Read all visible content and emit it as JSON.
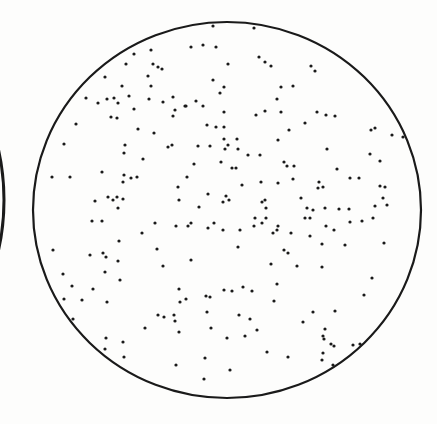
{
  "figure": {
    "background_color": "#fdfdfc",
    "ink_color": "#1a1a1a",
    "plate": {
      "cx": 227,
      "cy": 210,
      "rx": 194,
      "ry": 188,
      "stroke_width": 2.2
    },
    "neighbor_arc": {
      "cx": -150,
      "cy": 200,
      "rx": 154,
      "ry": 190,
      "stroke_width": 3
    },
    "dot_radius": 1.6,
    "dots": [
      [
        213,
        26
      ],
      [
        191,
        47
      ],
      [
        203,
        45
      ],
      [
        216,
        47
      ],
      [
        151,
        50
      ],
      [
        134,
        54
      ],
      [
        126,
        64
      ],
      [
        153,
        64
      ],
      [
        158,
        67
      ],
      [
        162,
        69
      ],
      [
        105,
        77
      ],
      [
        148,
        76
      ],
      [
        213,
        80
      ],
      [
        122,
        86
      ],
      [
        151,
        86
      ],
      [
        86,
        98
      ],
      [
        98,
        103
      ],
      [
        107,
        99
      ],
      [
        114,
        98
      ],
      [
        118,
        103
      ],
      [
        129,
        96
      ],
      [
        149,
        99
      ],
      [
        163,
        102
      ],
      [
        173,
        97
      ],
      [
        196,
        101
      ],
      [
        186,
        106
      ],
      [
        203,
        106
      ],
      [
        134,
        109
      ],
      [
        175,
        110
      ],
      [
        185,
        106
      ],
      [
        111,
        117
      ],
      [
        117,
        118
      ],
      [
        173,
        116
      ],
      [
        207,
        125
      ],
      [
        216,
        127
      ],
      [
        138,
        129
      ],
      [
        154,
        133
      ],
      [
        76,
        124
      ],
      [
        64,
        144
      ],
      [
        125,
        145
      ],
      [
        124,
        153
      ],
      [
        168,
        147
      ],
      [
        198,
        146
      ],
      [
        210,
        146
      ],
      [
        172,
        145
      ],
      [
        143,
        159
      ],
      [
        194,
        164
      ],
      [
        52,
        177
      ],
      [
        70,
        177
      ],
      [
        102,
        172
      ],
      [
        124,
        175
      ],
      [
        123,
        182
      ],
      [
        131,
        178
      ],
      [
        137,
        177
      ],
      [
        178,
        187
      ],
      [
        187,
        177
      ],
      [
        208,
        194
      ],
      [
        179,
        200
      ],
      [
        95,
        201
      ],
      [
        108,
        197
      ],
      [
        113,
        200
      ],
      [
        117,
        197
      ],
      [
        123,
        199
      ],
      [
        118,
        208
      ],
      [
        199,
        207
      ],
      [
        254,
        28
      ],
      [
        228,
        64
      ],
      [
        259,
        57
      ],
      [
        265,
        62
      ],
      [
        271,
        66
      ],
      [
        311,
        66
      ],
      [
        315,
        71
      ],
      [
        224,
        87
      ],
      [
        281,
        87
      ],
      [
        293,
        86
      ],
      [
        220,
        93
      ],
      [
        277,
        99
      ],
      [
        224,
        112
      ],
      [
        256,
        115
      ],
      [
        265,
        111
      ],
      [
        281,
        112
      ],
      [
        317,
        112
      ],
      [
        326,
        115
      ],
      [
        335,
        116
      ],
      [
        305,
        123
      ],
      [
        224,
        127
      ],
      [
        224,
        139
      ],
      [
        228,
        145
      ],
      [
        237,
        139
      ],
      [
        278,
        140
      ],
      [
        289,
        130
      ],
      [
        225,
        149
      ],
      [
        238,
        149
      ],
      [
        248,
        155
      ],
      [
        260,
        155
      ],
      [
        327,
        149
      ],
      [
        371,
        130
      ],
      [
        375,
        128
      ],
      [
        392,
        135
      ],
      [
        403,
        137
      ],
      [
        370,
        154
      ],
      [
        380,
        161
      ],
      [
        221,
        162
      ],
      [
        232,
        168
      ],
      [
        236,
        168
      ],
      [
        284,
        162
      ],
      [
        287,
        166
      ],
      [
        294,
        166
      ],
      [
        337,
        169
      ],
      [
        359,
        178
      ],
      [
        350,
        178
      ],
      [
        380,
        186
      ],
      [
        385,
        187
      ],
      [
        242,
        185
      ],
      [
        261,
        182
      ],
      [
        278,
        183
      ],
      [
        293,
        179
      ],
      [
        319,
        182
      ],
      [
        323,
        187
      ],
      [
        318,
        188
      ],
      [
        387,
        205
      ],
      [
        383,
        198
      ],
      [
        226,
        196
      ],
      [
        223,
        202
      ],
      [
        229,
        200
      ],
      [
        262,
        202
      ],
      [
        265,
        200
      ],
      [
        266,
        208
      ],
      [
        301,
        198
      ],
      [
        307,
        208
      ],
      [
        313,
        210
      ],
      [
        325,
        208
      ],
      [
        339,
        209
      ],
      [
        349,
        209
      ],
      [
        375,
        206
      ],
      [
        92,
        221
      ],
      [
        102,
        221
      ],
      [
        155,
        223
      ],
      [
        176,
        226
      ],
      [
        142,
        233
      ],
      [
        188,
        226
      ],
      [
        191,
        223
      ],
      [
        208,
        228
      ],
      [
        214,
        223
      ],
      [
        119,
        241
      ],
      [
        53,
        250
      ],
      [
        90,
        255
      ],
      [
        103,
        253
      ],
      [
        106,
        257
      ],
      [
        118,
        261
      ],
      [
        157,
        249
      ],
      [
        163,
        266
      ],
      [
        191,
        260
      ],
      [
        105,
        272
      ],
      [
        63,
        274
      ],
      [
        72,
        286
      ],
      [
        93,
        289
      ],
      [
        82,
        300
      ],
      [
        64,
        299
      ],
      [
        107,
        302
      ],
      [
        120,
        280
      ],
      [
        179,
        289
      ],
      [
        186,
        299
      ],
      [
        180,
        302
      ],
      [
        206,
        296
      ],
      [
        207,
        312
      ],
      [
        211,
        328
      ],
      [
        158,
        315
      ],
      [
        164,
        317
      ],
      [
        174,
        315
      ],
      [
        175,
        321
      ],
      [
        179,
        332
      ],
      [
        145,
        328
      ],
      [
        210,
        297
      ],
      [
        73,
        319
      ],
      [
        106,
        338
      ],
      [
        123,
        342
      ],
      [
        105,
        349
      ],
      [
        124,
        357
      ],
      [
        176,
        365
      ],
      [
        205,
        358
      ],
      [
        204,
        379
      ],
      [
        223,
        230
      ],
      [
        240,
        230
      ],
      [
        255,
        218
      ],
      [
        254,
        226
      ],
      [
        262,
        223
      ],
      [
        266,
        218
      ],
      [
        278,
        226
      ],
      [
        277,
        230
      ],
      [
        273,
        233
      ],
      [
        305,
        218
      ],
      [
        291,
        233
      ],
      [
        310,
        218
      ],
      [
        334,
        230
      ],
      [
        326,
        226
      ],
      [
        350,
        222
      ],
      [
        362,
        221
      ],
      [
        373,
        218
      ],
      [
        384,
        243
      ],
      [
        238,
        247
      ],
      [
        284,
        250
      ],
      [
        288,
        253
      ],
      [
        310,
        236
      ],
      [
        322,
        244
      ],
      [
        345,
        245
      ],
      [
        322,
        267
      ],
      [
        271,
        264
      ],
      [
        277,
        284
      ],
      [
        297,
        266
      ],
      [
        224,
        290
      ],
      [
        232,
        291
      ],
      [
        243,
        287
      ],
      [
        252,
        291
      ],
      [
        372,
        278
      ],
      [
        274,
        301
      ],
      [
        313,
        312
      ],
      [
        364,
        295
      ],
      [
        239,
        315
      ],
      [
        250,
        319
      ],
      [
        335,
        311
      ],
      [
        257,
        330
      ],
      [
        227,
        338
      ],
      [
        245,
        336
      ],
      [
        303,
        322
      ],
      [
        325,
        329
      ],
      [
        331,
        344
      ],
      [
        323,
        336
      ],
      [
        324,
        339
      ],
      [
        288,
        357
      ],
      [
        267,
        352
      ],
      [
        323,
        353
      ],
      [
        322,
        360
      ],
      [
        334,
        346
      ],
      [
        353,
        345
      ],
      [
        360,
        344
      ],
      [
        230,
        370
      ],
      [
        333,
        365
      ]
    ]
  }
}
